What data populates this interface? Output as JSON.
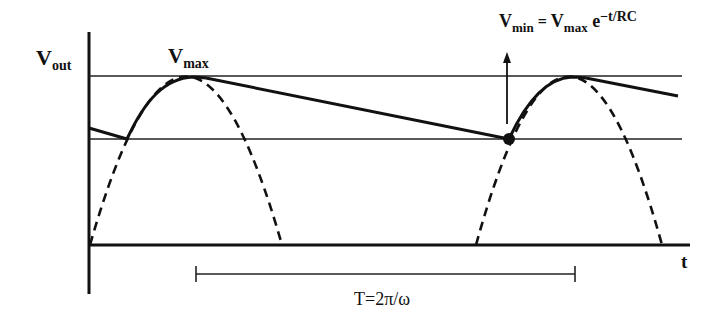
{
  "diagram": {
    "labels": {
      "y_axis_main": "V",
      "y_axis_sub": "out",
      "vmax_main": "V",
      "vmax_sub": "max",
      "x_axis": "t",
      "period": "T=2π/ω",
      "formula_v1": "V",
      "formula_v1_sub": "min",
      "formula_eq": " = ",
      "formula_v2": "V",
      "formula_v2_sub": "max",
      "formula_e": " e",
      "formula_exp": "−t/RC"
    },
    "colors": {
      "ink": "#111111",
      "background": "#ffffff"
    },
    "reference_lines": [
      "Vmax",
      "Vmin"
    ],
    "annotations": {
      "min_point": "V_min marker (dot)",
      "arrow": "up-arrow at V_min"
    }
  }
}
